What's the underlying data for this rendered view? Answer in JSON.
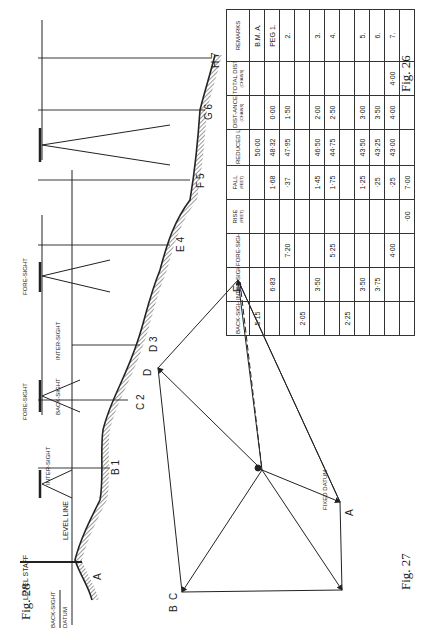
{
  "page": {
    "orientation": "rotated-90-ccw",
    "background": "#ffffff",
    "ink": "#222222"
  },
  "figures": {
    "fig26": {
      "label": "Fig. 26",
      "title": "Profile levelling section",
      "annotations": {
        "level_staff": "LEVEL STAFF",
        "level_line": "LEVEL LINE",
        "back_sight": "BACK-SIGHT",
        "datum": "DATUM",
        "inter_sight_1": "INTER-SIGHT",
        "fore_sight_1": "FORE-SIGHT",
        "back_sight_2": "BACK-SIGHT",
        "inter_sight_2": "INTER-SIGHT",
        "fore_sight_2": "FORE-SIGHT"
      },
      "stations": [
        {
          "letter": "A",
          "number": ""
        },
        {
          "letter": "B",
          "number": "1"
        },
        {
          "letter": "C",
          "number": "2"
        },
        {
          "letter": "D",
          "number": "3"
        },
        {
          "letter": "E",
          "number": "4"
        },
        {
          "letter": "F",
          "number": "5"
        },
        {
          "letter": "G",
          "number": "6"
        },
        {
          "letter": "H",
          "number": "7"
        }
      ]
    },
    "fig27": {
      "label": "Fig. 27",
      "table": {
        "headers": [
          {
            "main": "BACK-SIGHT",
            "sub": ""
          },
          {
            "main": "INTER-SIGHT",
            "sub": ""
          },
          {
            "main": "FORE-SIGHT",
            "sub": ""
          },
          {
            "main": "RISE",
            "sub": "(FEET)"
          },
          {
            "main": "FALL",
            "sub": "(FEET)"
          },
          {
            "main": "REDUCED LEVELS",
            "sub": ""
          },
          {
            "main": "DIST-ANCE",
            "sub": "(CHAINS)"
          },
          {
            "main": "TOTAL DISTANCE",
            "sub": "(CHAINS)"
          },
          {
            "main": "REMARKS",
            "sub": ""
          }
        ],
        "rows": [
          [
            "5·15",
            "",
            "",
            "",
            "",
            "50·00",
            "",
            "",
            "B.M.  A."
          ],
          [
            "",
            "6·83",
            "",
            "",
            "1·68",
            "48·32",
            "0·00",
            "",
            "PEG  1."
          ],
          [
            "",
            "",
            "7·20",
            "",
            "·37",
            "47·95",
            "1·50",
            "",
            "2."
          ],
          [
            "2·05",
            "",
            "",
            "",
            "",
            "",
            "",
            "",
            ""
          ],
          [
            "",
            "3·50",
            "",
            "",
            "1·45",
            "46·50",
            "2·00",
            "",
            "3."
          ],
          [
            "",
            "",
            "5·25",
            "",
            "1·75",
            "44·75",
            "2·50",
            "",
            "4."
          ],
          [
            "2·25",
            "",
            "",
            "",
            "",
            "",
            "",
            "",
            ""
          ],
          [
            "",
            "3·50",
            "",
            "",
            "1·25",
            "43·50",
            "3·00",
            "",
            "5."
          ],
          [
            "",
            "3·75",
            "",
            "",
            "·25",
            "43·25",
            "3·50",
            "",
            "6."
          ],
          [
            "",
            "",
            "4·00",
            "",
            "·25",
            "43·00",
            "4·00",
            "4·00",
            "7."
          ],
          [
            "",
            "",
            "",
            "·00",
            "7·00",
            "",
            "",
            "",
            ""
          ]
        ]
      }
    },
    "fig28": {
      "label": "Fig. 28",
      "points": [
        "A",
        "B",
        "C",
        "D",
        "E"
      ],
      "annotation": "FIXED DATUM"
    }
  }
}
